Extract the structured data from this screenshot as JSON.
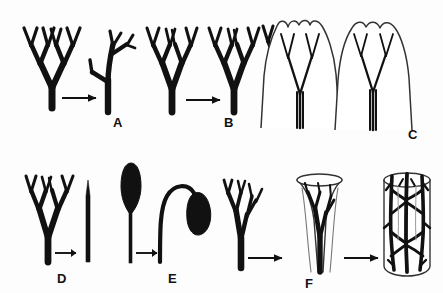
{
  "figure": {
    "background_color": "#fdfdfd",
    "ink_color": "#111111",
    "outline_color": "#222222",
    "width": 443,
    "height": 293
  },
  "panels": [
    {
      "id": "A",
      "label": "A",
      "label_x": 113,
      "label_y": 116,
      "process": "overtopping",
      "stage_count": 2,
      "arrow_count": 1,
      "description": "Equal dichotomous branching system becomes unequal: one axis overtops and dominates, the other becomes a lateral branch.",
      "stages": [
        "equal dichotomy",
        "overtopped axis with laterals"
      ]
    },
    {
      "id": "B",
      "label": "B",
      "label_x": 224,
      "label_y": 116,
      "process": "planation",
      "stage_count": 2,
      "arrow_count": 1,
      "description": "Three-dimensional branching system is flattened into one plane.",
      "stages": [
        "three-dimensional branching",
        "planated branching"
      ]
    },
    {
      "id": "C",
      "label": "C",
      "label_x": 408,
      "label_y": 128,
      "process": "webbing",
      "stage_count": 3,
      "arrow_count": 2,
      "description": "Tissue webs between the planated branches, progressively filling the gaps to form a laminate blade.",
      "stages": [
        "planated branches",
        "partial webbing",
        "complete webbing / blade"
      ]
    },
    {
      "id": "D",
      "label": "D",
      "label_x": 57,
      "label_y": 272,
      "process": "reduction",
      "stage_count": 2,
      "arrow_count": 1,
      "description": "The branching system is reduced to a single unbranched axis or spine.",
      "stages": [
        "branched axis",
        "reduced single axis"
      ]
    },
    {
      "id": "E",
      "label": "E",
      "label_x": 168,
      "label_y": 272,
      "process": "recurvation",
      "stage_count": 2,
      "arrow_count": 1,
      "description": "An erect club-shaped sporangium on a straight stalk becomes recurved and pendant.",
      "stages": [
        "erect clavate sporangium",
        "recurved pendant sporangium"
      ]
    },
    {
      "id": "F",
      "label": "F",
      "label_x": 305,
      "label_y": 277,
      "process": "fusion / reticulation",
      "stage_count": 3,
      "arrow_count": 2,
      "description": "Branches become enclosed in tissue and then fuse laterally into a reticulate network within a cylinder.",
      "stages": [
        "branching axis",
        "enclosed in funnel of tissue",
        "reticulate network in cylinder"
      ]
    }
  ]
}
